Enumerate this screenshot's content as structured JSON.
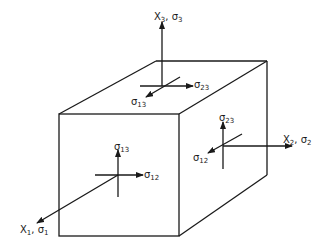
{
  "diagram": {
    "title": "",
    "type": "stress element cube",
    "stroke_color": "#1a1a1a",
    "background": "#ffffff",
    "axes": [
      {
        "id": "x1",
        "label_main": "X",
        "label_sub": "1",
        "stress_main": "σ",
        "stress_sub": "1"
      },
      {
        "id": "x2",
        "label_main": "X",
        "label_sub": "2",
        "stress_main": "σ",
        "stress_sub": "2"
      },
      {
        "id": "x3",
        "label_main": "X",
        "label_sub": "3",
        "stress_main": "σ",
        "stress_sub": "3"
      }
    ],
    "top_face": {
      "shear_a": {
        "main": "σ",
        "sub": "13"
      },
      "shear_b": {
        "main": "σ",
        "sub": "23"
      }
    },
    "front_face": {
      "shear_a": {
        "main": "σ",
        "sub": "13"
      },
      "shear_b": {
        "main": "σ",
        "sub": "12"
      }
    },
    "right_face": {
      "shear_a": {
        "main": "σ",
        "sub": "23"
      },
      "shear_b": {
        "main": "σ",
        "sub": "12"
      }
    }
  }
}
